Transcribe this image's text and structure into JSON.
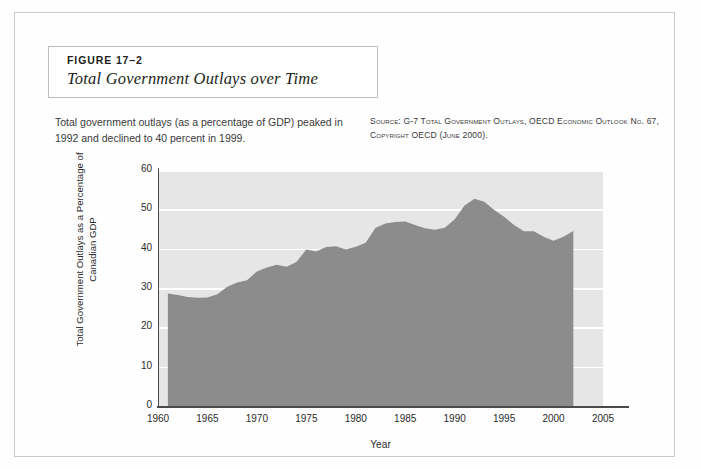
{
  "figure": {
    "number": "FIGURE 17–2",
    "title": "Total Government Outlays over Time"
  },
  "caption": "Total government outlays (as a percentage of GDP) peaked in 1992 and declined to 40 percent in 1999.",
  "source": "Source: G-7 Total Government Outlays, OECD Economic Outlook No. 67, Copyright OECD (June 2000).",
  "colors": {
    "area_fill": "#8c8c8c",
    "plot_background": "#e6e6e6",
    "gridline": "#ffffff",
    "axis": "#4a4a4a",
    "frame": "#c9c9c9"
  },
  "chart_data": {
    "type": "area",
    "title": "Total Government Outlays over Time",
    "xlabel": "Year",
    "ylabel": "Total Government Outlays as a Percentage of Canadian GDP",
    "xlim": [
      1960,
      2005
    ],
    "ylim": [
      0,
      60
    ],
    "xticks": [
      1960,
      1965,
      1970,
      1975,
      1980,
      1985,
      1990,
      1995,
      2000,
      2005
    ],
    "yticks": [
      0,
      10,
      20,
      30,
      40,
      50,
      60
    ],
    "grid": "horizontal-white",
    "legend": "none",
    "x": [
      1961,
      1962,
      1963,
      1964,
      1965,
      1966,
      1967,
      1968,
      1969,
      1970,
      1971,
      1972,
      1973,
      1974,
      1975,
      1976,
      1977,
      1978,
      1979,
      1980,
      1981,
      1982,
      1983,
      1984,
      1985,
      1986,
      1987,
      1988,
      1989,
      1990,
      1991,
      1992,
      1993,
      1994,
      1995,
      1996,
      1997,
      1998,
      1999,
      2000,
      2001,
      2002
    ],
    "values": [
      28.6,
      28.2,
      27.7,
      27.5,
      27.6,
      28.4,
      30.3,
      31.4,
      32.0,
      34.2,
      35.2,
      35.9,
      35.4,
      36.6,
      39.8,
      39.3,
      40.4,
      40.6,
      39.8,
      40.5,
      41.5,
      45.3,
      46.4,
      46.8,
      46.9,
      46.0,
      45.2,
      44.8,
      45.3,
      47.5,
      51.0,
      52.7,
      51.9,
      49.8,
      48.1,
      46.0,
      44.4,
      44.4,
      43.0,
      42.0,
      43.0,
      44.5
    ]
  },
  "ytick_labels": [
    "60",
    "50",
    "40",
    "30",
    "20",
    "10",
    "0"
  ],
  "xtick_labels": [
    "1960",
    "1965",
    "1970",
    "1975",
    "1980",
    "1985",
    "1990",
    "1995",
    "2000",
    "2005"
  ]
}
